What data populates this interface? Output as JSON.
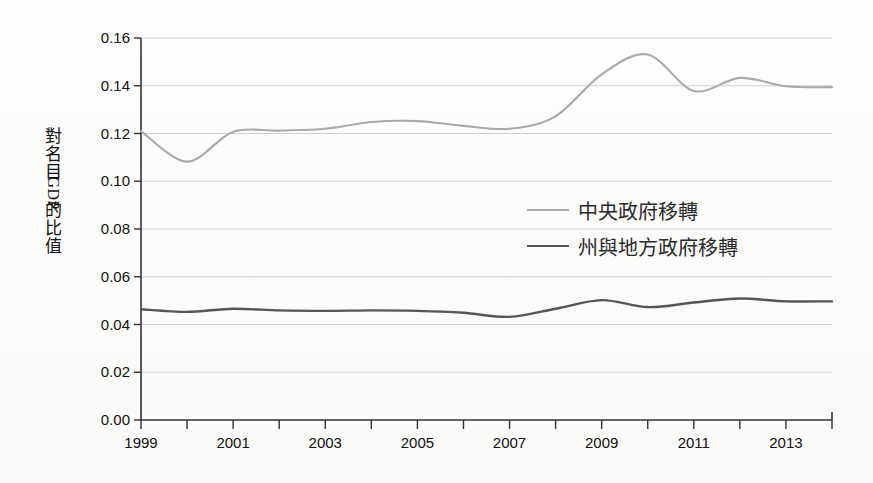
{
  "chart_data": {
    "type": "line",
    "title": "",
    "subtitle": "",
    "xlabel": "",
    "ylabel": "對名目 GDP 的比值",
    "ylabel_chars": [
      "對",
      "名",
      "目",
      "GDP",
      "的",
      "比",
      "值"
    ],
    "x": [
      1999,
      2000,
      2001,
      2002,
      2003,
      2004,
      2005,
      2006,
      2007,
      2008,
      2009,
      2010,
      2011,
      2012,
      2013,
      2014
    ],
    "xlim": [
      1999,
      2014
    ],
    "ylim": [
      0.0,
      0.16
    ],
    "yticks": [
      0.0,
      0.02,
      0.04,
      0.06,
      0.08,
      0.1,
      0.12,
      0.14,
      0.16
    ],
    "ytick_labels": [
      "0.00",
      "0.02",
      "0.04",
      "0.06",
      "0.08",
      "0.10",
      "0.12",
      "0.14",
      "0.16"
    ],
    "xticks": [
      1999,
      2000,
      2001,
      2002,
      2003,
      2004,
      2005,
      2006,
      2007,
      2008,
      2009,
      2010,
      2011,
      2012,
      2013,
      2014
    ],
    "xtick_labels": [
      "1999",
      "",
      "2001",
      "",
      "2003",
      "",
      "2005",
      "",
      "2007",
      "",
      "2009",
      "",
      "2011",
      "",
      "2013",
      ""
    ],
    "grid": true,
    "grid_axis": "y",
    "legend_position": "center-right",
    "series": [
      {
        "name": "中央政府移轉",
        "color": "#a9a9a9",
        "values": [
          0.121,
          0.1082,
          0.1207,
          0.1212,
          0.122,
          0.1248,
          0.1252,
          0.1232,
          0.122,
          0.1272,
          0.1448,
          0.1531,
          0.1378,
          0.1433,
          0.1398,
          0.1394
        ]
      },
      {
        "name": "州與地方政府移轉",
        "color": "#555555",
        "values": [
          0.0464,
          0.0453,
          0.0466,
          0.0459,
          0.0457,
          0.0459,
          0.0457,
          0.0449,
          0.0432,
          0.0466,
          0.0502,
          0.0473,
          0.0492,
          0.0509,
          0.0497,
          0.0497
        ]
      }
    ]
  },
  "legend": {
    "items": [
      {
        "label": "中央政府移轉",
        "color": "#a9a9a9"
      },
      {
        "label": "州與地方政府移轉",
        "color": "#555555"
      }
    ]
  },
  "axes": {
    "y_title_chars": [
      "對",
      "名",
      "目",
      "GDP",
      "的",
      "比",
      "值"
    ]
  }
}
